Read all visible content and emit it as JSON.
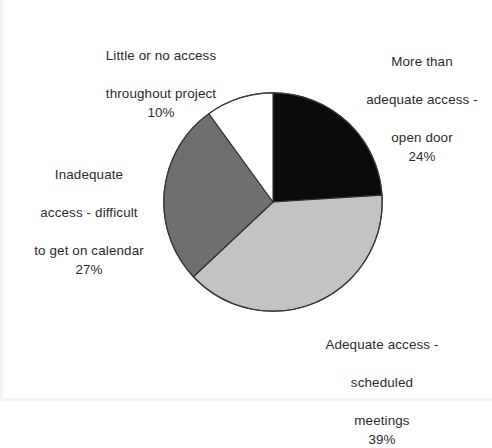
{
  "chart_data": {
    "type": "pie",
    "title": "",
    "subtitle": "",
    "xlabel": "",
    "ylabel": "",
    "legend_position": "none",
    "grid": false,
    "start_angle_deg": 0,
    "direction": "clockwise",
    "categories": [
      "More than adequate access - open door",
      "Adequate access - scheduled meetings",
      "Inadequate access - difficult to get on calendar",
      "Little or no access throughout project"
    ],
    "values": [
      24,
      39,
      27,
      10
    ],
    "value_unit": "%",
    "colors": [
      "#0b0b0b",
      "#c3c3c3",
      "#6f6f6f",
      "#ffffff"
    ],
    "slice_outline_color": "#2f2f2f",
    "slices": [
      {
        "name": "more-than-adequate",
        "label_line1": "More than",
        "label_line2": "adequate access -",
        "label_line3": "open door",
        "percent": "24%",
        "value": 24,
        "color": "#0b0b0b"
      },
      {
        "name": "adequate",
        "label_line1": "Adequate access -",
        "label_line2": "scheduled",
        "label_line3": "meetings",
        "percent": "39%",
        "value": 39,
        "color": "#c3c3c3"
      },
      {
        "name": "inadequate",
        "label_line1": "Inadequate",
        "label_line2": "access - difficult",
        "label_line3": "to get on calendar",
        "percent": "27%",
        "value": 27,
        "color": "#6f6f6f"
      },
      {
        "name": "little-or-no",
        "label_line1": "Little or no access",
        "label_line2": "throughout project",
        "label_line3": "",
        "percent": "10%",
        "value": 10,
        "color": "#ffffff"
      }
    ]
  },
  "labels": {
    "little": {
      "line1": "Little or no access",
      "line2": "throughout project",
      "percent": "10%"
    },
    "more": {
      "line1": "More than",
      "line2": "adequate access -",
      "line3": "open door",
      "percent": "24%"
    },
    "inadequate": {
      "line1": "Inadequate",
      "line2": "access - difficult",
      "line3": "to get on calendar",
      "percent": "27%"
    },
    "adequate": {
      "line1": "Adequate access -",
      "line2": "scheduled",
      "line3": "meetings",
      "percent": "39%"
    }
  }
}
